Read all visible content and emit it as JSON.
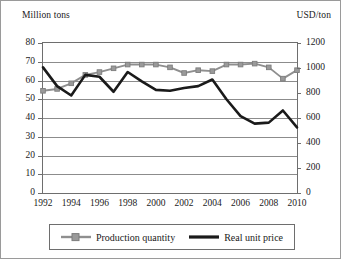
{
  "axis_titles": {
    "left": "Million tons",
    "right": "USD/ton"
  },
  "legend": {
    "production": "Production quantity",
    "price": "Real unit price"
  },
  "colors": {
    "production_line": "#8f8f8f",
    "price_line": "#1a1a1a",
    "gridline": "#8c8c8c",
    "plot_border": "#6e6e6e",
    "frame_border": "#9a9a9a",
    "background": "#ffffff"
  },
  "chart_data": {
    "type": "line",
    "title": "",
    "xlabel": "",
    "ylabel": "Million tons",
    "y2label": "USD/ton",
    "grid": true,
    "legend_position": "bottom",
    "x": [
      1992,
      1993,
      1994,
      1995,
      1996,
      1997,
      1998,
      1999,
      2000,
      2001,
      2002,
      2003,
      2004,
      2005,
      2006,
      2007,
      2008,
      2009,
      2010
    ],
    "xlim": [
      1992,
      2010
    ],
    "xticks": [
      1992,
      1994,
      1996,
      1998,
      2000,
      2002,
      2004,
      2006,
      2008,
      2010
    ],
    "xtick_labels": [
      "1992",
      "1994",
      "1996",
      "1998",
      "2000",
      "2002",
      "2004",
      "2006",
      "2008",
      "2010"
    ],
    "ylim": [
      0,
      80
    ],
    "yticks": [
      0,
      10,
      20,
      30,
      40,
      50,
      60,
      70,
      80
    ],
    "ytick_labels": [
      "0",
      "10",
      "20",
      "30",
      "40",
      "50",
      "60",
      "70",
      "80"
    ],
    "y2lim": [
      0,
      1200
    ],
    "y2ticks": [
      0,
      200,
      400,
      600,
      800,
      1000,
      1200
    ],
    "y2tick_labels": [
      "0",
      "200",
      "400",
      "600",
      "800",
      "1000",
      "1200"
    ],
    "series": [
      {
        "name": "Production quantity",
        "axis": "left",
        "unit": "Million tons",
        "marker": "square",
        "values": [
          54.5,
          55.5,
          58.5,
          63.0,
          64.5,
          66.5,
          68.5,
          68.5,
          68.5,
          67.0,
          64.0,
          65.5,
          65.0,
          68.5,
          68.5,
          69.0,
          67.0,
          61.0,
          65.5
        ]
      },
      {
        "name": "Real unit price",
        "axis": "right",
        "unit": "USD/ton",
        "marker": "none",
        "values": [
          1005,
          855,
          780,
          945,
          930,
          810,
          968,
          893,
          825,
          818,
          840,
          855,
          908,
          750,
          615,
          555,
          563,
          660,
          525
        ]
      }
    ]
  }
}
